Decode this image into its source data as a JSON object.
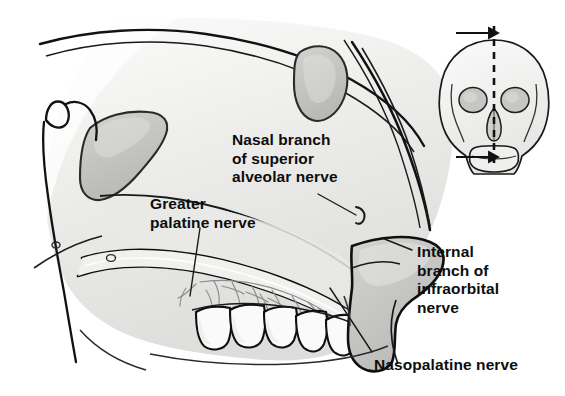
{
  "figure": {
    "background_color": "#ffffff",
    "ink_color": "#0d0d0d",
    "tissue_light": "#f2f2f0",
    "tissue_mid": "#dcdcda",
    "tissue_dark": "#c3c3c1",
    "sinus_fill": "#c9c9c7",
    "width": 565,
    "height": 396
  },
  "labels": {
    "nasal_branch": "Nasal branch\nof superior\nalveolar nerve",
    "greater_palatine": "Greater\npalatine nerve",
    "internal_branch": "Internal\nbranch of\ninfraorbital\nnerve",
    "nasopalatine": "Nasopalatine nerve"
  },
  "inset": {
    "name": "anterior-skull-orientation-diagram",
    "plane": "mid-sagittal",
    "plane_line_style": "dashed",
    "arrows": 2,
    "arrow_direction": "right"
  },
  "structures": [
    "sphenoid-sinus",
    "frontal-sinus",
    "nasal-septum",
    "hard-palate",
    "maxillary-teeth",
    "upper-lip",
    "nasal-tip",
    "palatine-nerve-plexus",
    "incisive-canal"
  ]
}
